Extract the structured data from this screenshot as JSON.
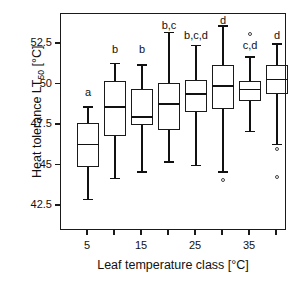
{
  "chart_data": {
    "type": "box",
    "title": "",
    "xlabel": "Leaf temperature class [°C]",
    "ylabel_text": "Heat tolerance LT",
    "ylabel_sub": "50",
    "ylabel_unit": " [°C]",
    "ylabel_full": "Heat tolerance LT50 [°C]",
    "ylim": [
      41.2,
      53.8
    ],
    "yticks": [
      42.5,
      45,
      47.5,
      50,
      52.5
    ],
    "ytick_labels": [
      "42.5",
      "45",
      "47.5",
      "50",
      "52.5"
    ],
    "xticks": [
      5,
      10,
      15,
      20,
      25,
      30,
      35,
      40
    ],
    "xtick_labels": [
      "5",
      "",
      "15",
      "",
      "25",
      "",
      "35",
      ""
    ],
    "grid": false,
    "legend": false,
    "categories": [
      "5",
      "10",
      "15",
      "20",
      "25",
      "30",
      "35",
      "40"
    ],
    "boxes": [
      {
        "category": "5",
        "whisker_low": 42.9,
        "q1": 44.9,
        "median": 46.3,
        "q3": 47.6,
        "whisker_high": 48.6,
        "outliers": [],
        "group_label": "a",
        "label_y": 49.5
      },
      {
        "category": "10",
        "whisker_low": 44.2,
        "q1": 46.8,
        "median": 48.6,
        "q3": 50.2,
        "whisker_high": 51.3,
        "outliers": [],
        "group_label": "b",
        "label_y": 52.1
      },
      {
        "category": "15",
        "whisker_low": 44.6,
        "q1": 47.5,
        "median": 48.0,
        "q3": 49.7,
        "whisker_high": 51.2,
        "outliers": [],
        "group_label": "b",
        "label_y": 52.1
      },
      {
        "category": "20",
        "whisker_low": 45.2,
        "q1": 47.2,
        "median": 48.8,
        "q3": 50.1,
        "whisker_high": 53.2,
        "outliers": [],
        "group_label": "b,c",
        "label_y": 53.6
      },
      {
        "category": "25",
        "whisker_low": 45.0,
        "q1": 48.3,
        "median": 49.4,
        "q3": 50.3,
        "whisker_high": 52.4,
        "outliers": [],
        "group_label": "b,c,d",
        "label_y": 53.0
      },
      {
        "category": "30",
        "whisker_low": 44.6,
        "q1": 48.5,
        "median": 49.9,
        "q3": 51.2,
        "whisker_high": 53.6,
        "outliers": [
          44.1
        ],
        "group_label": "d",
        "label_y": 53.9
      },
      {
        "category": "35",
        "whisker_low": 47.1,
        "q1": 49.0,
        "median": 49.7,
        "q3": 50.2,
        "whisker_high": 51.7,
        "outliers": [
          53.1
        ],
        "group_label": "c,d",
        "label_y": 52.4
      },
      {
        "category": "40",
        "whisker_low": 46.3,
        "q1": 49.4,
        "median": 50.3,
        "q3": 51.2,
        "whisker_high": 52.5,
        "outliers": [
          46.0,
          44.3
        ],
        "group_label": "d",
        "label_y": 53.0
      }
    ]
  }
}
